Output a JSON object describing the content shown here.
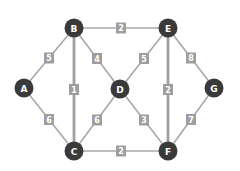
{
  "graph": {
    "nodes": [
      {
        "id": "A",
        "x": 24,
        "y": 88
      },
      {
        "id": "B",
        "x": 74,
        "y": 28
      },
      {
        "id": "C",
        "x": 74,
        "y": 151
      },
      {
        "id": "D",
        "x": 120,
        "y": 89
      },
      {
        "id": "E",
        "x": 168,
        "y": 28
      },
      {
        "id": "F",
        "x": 168,
        "y": 151
      },
      {
        "id": "G",
        "x": 214,
        "y": 88
      }
    ],
    "edges": [
      {
        "from": "A",
        "to": "B",
        "weight": "5",
        "thick": false
      },
      {
        "from": "A",
        "to": "C",
        "weight": "6",
        "thick": false
      },
      {
        "from": "B",
        "to": "E",
        "weight": "2",
        "thick": false
      },
      {
        "from": "B",
        "to": "C",
        "weight": "1",
        "thick": true
      },
      {
        "from": "B",
        "to": "D",
        "weight": "4",
        "thick": false
      },
      {
        "from": "D",
        "to": "E",
        "weight": "5",
        "thick": false
      },
      {
        "from": "D",
        "to": "C",
        "weight": "6",
        "thick": false
      },
      {
        "from": "D",
        "to": "F",
        "weight": "3",
        "thick": false
      },
      {
        "from": "E",
        "to": "F",
        "weight": "2",
        "thick": true
      },
      {
        "from": "E",
        "to": "G",
        "weight": "8",
        "thick": false
      },
      {
        "from": "G",
        "to": "F",
        "weight": "7",
        "thick": false
      },
      {
        "from": "C",
        "to": "F",
        "weight": "2",
        "thick": false
      }
    ]
  },
  "colors": {
    "node": "#3a3a3a",
    "edge": "#a8a8a8",
    "label_box": "#9e9e9e",
    "text": "#ffffff"
  }
}
